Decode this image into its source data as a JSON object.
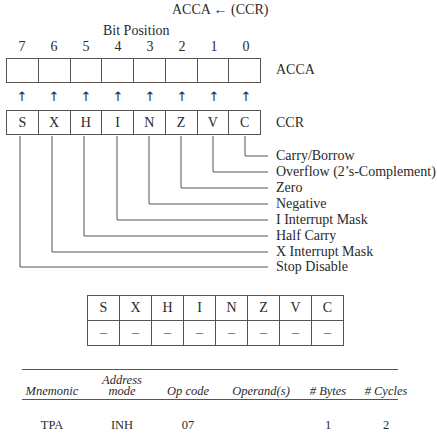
{
  "title": "ACCA ← (CCR)",
  "bit_position_label": "Bit Position",
  "bit_numbers": [
    "7",
    "6",
    "5",
    "4",
    "3",
    "2",
    "1",
    "0"
  ],
  "acca": {
    "label": "ACCA",
    "cells": [
      "",
      "",
      "",
      "",
      "",
      "",
      "",
      ""
    ]
  },
  "arrows": [
    "↑",
    "↑",
    "↑",
    "↑",
    "↑",
    "↑",
    "↑",
    "↑"
  ],
  "ccr": {
    "label": "CCR",
    "cells": [
      "S",
      "X",
      "H",
      "I",
      "N",
      "Z",
      "V",
      "C"
    ]
  },
  "flag_descriptions": [
    "Carry/Borrow",
    "Overflow (2’s-Complement)",
    "Zero",
    "Negative",
    "I Interrupt Mask",
    "Half Carry",
    "X Interrupt Mask",
    "Stop Disable"
  ],
  "flags_table": {
    "headers": [
      "S",
      "X",
      "H",
      "I",
      "N",
      "Z",
      "V",
      "C"
    ],
    "values": [
      "–",
      "–",
      "–",
      "–",
      "–",
      "–",
      "–",
      "–"
    ]
  },
  "instruction_table": {
    "headers": {
      "mnemonic": "Mnemonic",
      "address_mode_1": "Address",
      "address_mode_2": "mode",
      "op_code": "Op code",
      "operands": "Operand(s)",
      "bytes": "# Bytes",
      "cycles": "# Cycles"
    },
    "rows": [
      {
        "mnemonic": "TPA",
        "address_mode": "INH",
        "op_code": "07",
        "operands": "",
        "bytes": "1",
        "cycles": "2"
      }
    ]
  }
}
